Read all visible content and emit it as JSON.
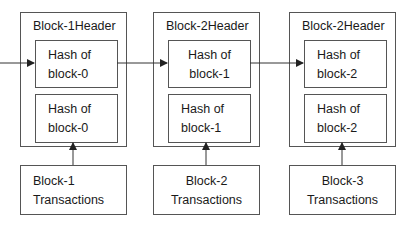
{
  "diagram": {
    "type": "blockchain-structure",
    "colors": {
      "stroke": "#555555",
      "text": "#1a1a1a",
      "background": "#ffffff"
    },
    "blocks": [
      {
        "header_label": "Block-1Header",
        "prev_hash": {
          "line1": "Hash of",
          "line2": "block-0"
        },
        "tx_hash": {
          "line1": "Hash of",
          "line2": "block-0"
        },
        "transactions": {
          "line1": "Block-1",
          "line2": "Transactions"
        }
      },
      {
        "header_label": "Block-2Header",
        "prev_hash": {
          "line1": "Hash of",
          "line2": "block-1"
        },
        "tx_hash": {
          "line1": "Hash of",
          "line2": "block-1"
        },
        "transactions": {
          "line1": "Block-2",
          "line2": "Transactions"
        }
      },
      {
        "header_label": "Block-2Header",
        "prev_hash": {
          "line1": "Hash of",
          "line2": "block-2"
        },
        "tx_hash": {
          "line1": "Hash of",
          "line2": "block-2"
        },
        "transactions": {
          "line1": "Block-3",
          "line2": "Transactions"
        }
      }
    ],
    "edges": [
      {
        "from": "incoming",
        "to": "block-1.prev_hash"
      },
      {
        "from": "block-1",
        "to": "block-2.prev_hash"
      },
      {
        "from": "block-2",
        "to": "block-3.prev_hash"
      },
      {
        "from": "block-1.transactions",
        "to": "block-1.tx_hash"
      },
      {
        "from": "block-2.transactions",
        "to": "block-2.tx_hash"
      },
      {
        "from": "block-3.transactions",
        "to": "block-3.tx_hash"
      }
    ]
  }
}
